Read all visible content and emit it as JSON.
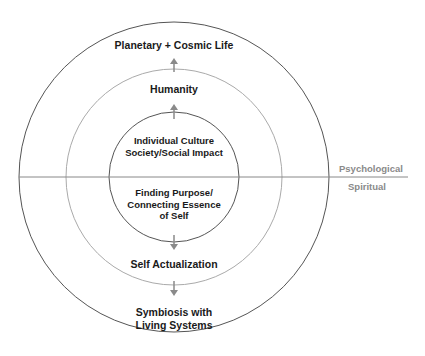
{
  "diagram": {
    "type": "concentric-circles",
    "center": {
      "x": 174,
      "y": 177
    },
    "circles": [
      {
        "name": "outer",
        "radius": 155,
        "stroke": "#555555"
      },
      {
        "name": "middle",
        "radius": 108,
        "stroke": "#aaaaaa"
      },
      {
        "name": "inner",
        "radius": 65,
        "stroke": "#555555"
      }
    ],
    "divider_color": "#888888",
    "arrow_color": "#8a8a8a",
    "upper_half": {
      "outer_label": "Planetary + Cosmic Life",
      "middle_label": "Humanity",
      "inner_label_line1": "Individual Culture",
      "inner_label_line2": "Society/Social Impact"
    },
    "lower_half": {
      "inner_label_line1": "Finding Purpose/",
      "inner_label_line2": "Connecting Essence",
      "inner_label_line3": "of Self",
      "middle_label": "Self Actualization",
      "outer_label_line1": "Symbiosis with",
      "outer_label_line2": "Living Systems"
    },
    "side_labels": {
      "above_line": "Psychological",
      "below_line": "Spiritual"
    }
  }
}
